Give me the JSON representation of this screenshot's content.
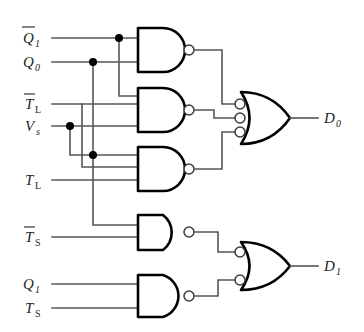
{
  "diagram": {
    "type": "logic-gate-schematic",
    "background_color": "#ffffff",
    "wire_color": "#55565a",
    "gate_outline_color": "#000000"
  },
  "inputs": [
    {
      "id": "in-qbar1",
      "base": "Q",
      "sub": "1",
      "overbar": true,
      "label": "Q̅1",
      "y": 38
    },
    {
      "id": "in-q0",
      "base": "Q",
      "sub": "0",
      "overbar": false,
      "label": "Q0",
      "y": 62
    },
    {
      "id": "in-tbarl",
      "base": "T",
      "sub": "L",
      "overbar": true,
      "label": "T̅L",
      "y": 104
    },
    {
      "id": "in-vs",
      "base": "V",
      "sub": "s",
      "overbar": false,
      "label": "Vs",
      "y": 126
    },
    {
      "id": "in-tl",
      "base": "T",
      "sub": "L",
      "overbar": false,
      "label": "TL",
      "y": 180
    },
    {
      "id": "in-tbars",
      "base": "T",
      "sub": "S",
      "overbar": true,
      "label": "T̅S",
      "y": 237
    },
    {
      "id": "in-q1",
      "base": "Q",
      "sub": "1",
      "overbar": false,
      "label": "Q1",
      "y": 284
    },
    {
      "id": "in-ts",
      "base": "T",
      "sub": "S",
      "overbar": false,
      "label": "TS",
      "y": 308
    }
  ],
  "outputs": [
    {
      "id": "out-d0",
      "base": "D",
      "sub": "0",
      "label": "D0",
      "x": 320,
      "y": 118
    },
    {
      "id": "out-d1",
      "base": "D",
      "sub": "1",
      "label": "D1",
      "x": 320,
      "y": 266
    }
  ],
  "gates": [
    {
      "id": "nand-1",
      "type": "NAND",
      "inputs": 2,
      "feeds": "or-d0"
    },
    {
      "id": "nand-2",
      "type": "NAND",
      "inputs": 3,
      "feeds": "or-d0"
    },
    {
      "id": "nand-3",
      "type": "NAND",
      "inputs": 3,
      "feeds": "or-d0"
    },
    {
      "id": "nand-4",
      "type": "NAND",
      "inputs": 2,
      "feeds": "or-d1"
    },
    {
      "id": "nand-5",
      "type": "NAND",
      "inputs": 2,
      "feeds": "or-d1"
    },
    {
      "id": "or-d0",
      "type": "OR-INVERTED-INPUTS",
      "inputs": 3,
      "feeds": "out-d0"
    },
    {
      "id": "or-d1",
      "type": "OR-INVERTED-INPUTS",
      "inputs": 2,
      "feeds": "out-d1"
    }
  ],
  "junctions": [
    {
      "id": "j-qbar1",
      "x": 119,
      "y": 38
    },
    {
      "id": "j-q0",
      "x": 93,
      "y": 62
    },
    {
      "id": "j-vs",
      "x": 70,
      "y": 126
    },
    {
      "id": "j-vs-2",
      "x": 93,
      "y": 155
    }
  ]
}
